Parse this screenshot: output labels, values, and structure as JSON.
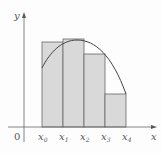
{
  "diagram": {
    "axes": {
      "x_label": "x",
      "y_label": "y",
      "origin_label": "0"
    },
    "ticks": [
      {
        "base": "x",
        "sub": "0"
      },
      {
        "base": "x",
        "sub": "1"
      },
      {
        "base": "x",
        "sub": "2"
      },
      {
        "base": "x",
        "sub": "3"
      },
      {
        "base": "x",
        "sub": "4"
      }
    ],
    "rectangles": [
      {
        "from": "x0",
        "to": "x1"
      },
      {
        "from": "x1",
        "to": "x2"
      },
      {
        "from": "x2",
        "to": "x3"
      },
      {
        "from": "x3",
        "to": "x4"
      }
    ],
    "colors": {
      "rect_fill": "#d9d9d9",
      "stroke": "#555555",
      "curve": "#444444"
    }
  }
}
